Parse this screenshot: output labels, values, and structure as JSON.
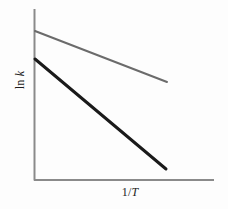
{
  "figure": {
    "background_color": "#fdfdfd",
    "width": 228,
    "height": 209,
    "y_axis_label": "ln k",
    "x_axis_label": "1/T",
    "axis_color": "#8a8a8a"
  },
  "chart_data": {
    "type": "line",
    "title": "",
    "subtitle": "",
    "xlabel": "1/T",
    "ylabel": "ln k",
    "xlim": [
      0,
      1
    ],
    "ylim": [
      0,
      1
    ],
    "grid": false,
    "legend": null,
    "ticks": {
      "x": [],
      "y": []
    },
    "annotations": [],
    "series": [
      {
        "name": "catalyzed",
        "color": "#6b6b6b",
        "width": 2,
        "comment": "upper line, shallower negative slope (smaller activation energy)",
        "x": [
          0.005,
          0.74
        ],
        "y": [
          0.87,
          0.57
        ],
        "pixel_points": [
          [
            35,
            31
          ],
          [
            167,
            82
          ]
        ],
        "slope": -0.405,
        "intercept": 0.872
      },
      {
        "name": "uncatalyzed",
        "color": "#1a1a1a",
        "width": 3,
        "comment": "lower line, steeper negative slope (larger activation energy)",
        "x": [
          0.005,
          0.73
        ],
        "y": [
          0.71,
          0.065
        ],
        "pixel_points": [
          [
            35,
            59
          ],
          [
            166,
            169
          ]
        ],
        "slope": -0.892,
        "intercept": 0.714
      }
    ]
  }
}
